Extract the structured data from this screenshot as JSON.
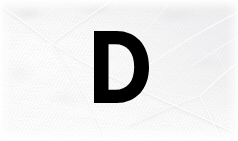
{
  "image": {
    "kind": "photograph-with-letter-overlay",
    "width": 238,
    "height": 141,
    "subject": "leaf-surface-macro",
    "alt_text": "Close-up of a pale white-gray leaf surface with faint radiating veins, overlaid with a large bold black letter D"
  },
  "background": {
    "name": "leaf-surface",
    "base_color": "#f4f4f4",
    "highlight_color": "#ffffff",
    "shadow_color": "#e4e4e8",
    "vein_color": "#fafafa",
    "vein_edge_color": "#e6e6ea",
    "description": "macro photograph of a leaf blade showing a network of pale raised veins"
  },
  "overlay": {
    "name": "letter-overlay",
    "character": "D",
    "color": "#000000",
    "weight": "bold",
    "bounds": {
      "x": 94,
      "y": 31,
      "width": 55,
      "height": 72
    }
  },
  "veins": {
    "count": 11,
    "junctions": [
      {
        "x": 52,
        "y": 43
      },
      {
        "x": 200,
        "y": 96
      },
      {
        "x": 118,
        "y": 68
      }
    ]
  }
}
